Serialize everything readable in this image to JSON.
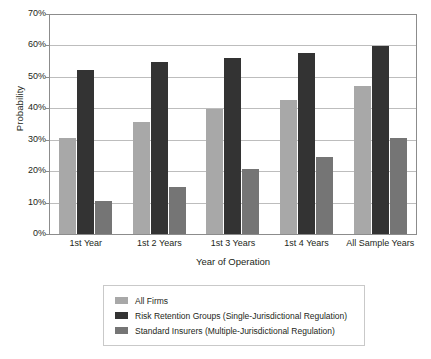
{
  "chart_data": {
    "type": "bar",
    "title": "",
    "xlabel": "Year of Operation",
    "ylabel": "Probability",
    "categories": [
      "1st Year",
      "1st 2 Years",
      "1st 3 Years",
      "1st 4 Years",
      "All Sample Years"
    ],
    "series": [
      {
        "name": "All Firms",
        "color": "#a8a8a8",
        "values": [
          30.5,
          35.8,
          39.8,
          42.8,
          47.2
        ]
      },
      {
        "name": "Risk Retention Groups (Single-Jurisdictional Regulation)",
        "color": "#333333",
        "values": [
          52.2,
          54.8,
          56.1,
          57.6,
          59.9
        ]
      },
      {
        "name": "Standard Insurers (Multiple-Jurisdictional Regulation)",
        "color": "#757575",
        "values": [
          10.6,
          15.0,
          20.6,
          24.4,
          30.6
        ]
      }
    ],
    "ylim": [
      0,
      70
    ],
    "yticks": [
      0,
      10,
      20,
      30,
      40,
      50,
      60,
      70
    ],
    "ytick_labels": [
      "0%",
      "10%",
      "20%",
      "30%",
      "40%",
      "50%",
      "60%",
      "70%"
    ],
    "grid": true,
    "legend_position": "bottom"
  }
}
